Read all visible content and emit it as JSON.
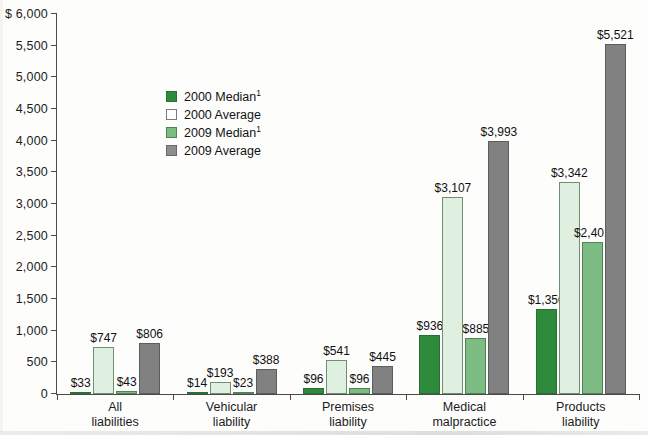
{
  "chart_data": {
    "type": "bar",
    "title": "",
    "xlabel": "",
    "ylabel": "",
    "y_axis_prefix": "$",
    "ylim": [
      0,
      6000
    ],
    "y_ticks": [
      0,
      500,
      1000,
      1500,
      2000,
      2500,
      3000,
      3500,
      4000,
      4500,
      5000,
      5500,
      6000
    ],
    "y_tick_labels": [
      "0",
      "500",
      "1,000",
      "1,500",
      "2,000",
      "2,500",
      "3,000",
      "3,500",
      "4,000",
      "4,500",
      "5,000",
      "5,500",
      "$ 6,000"
    ],
    "grid": false,
    "legend_position": "inside-upper-left",
    "categories": [
      "All liabilities",
      "Vehicular liability",
      "Premises liability",
      "Medical malpractice",
      "Products liability"
    ],
    "category_lines": [
      [
        "All",
        "liabilities"
      ],
      [
        "Vehicular",
        "liability"
      ],
      [
        "Premises",
        "liability"
      ],
      [
        "Medical",
        "malpractice"
      ],
      [
        "Products",
        "liability"
      ]
    ],
    "series": [
      {
        "name": "2000 Median",
        "footnote": "1",
        "color": "#2f8b3c",
        "values": [
          33,
          747,
          96,
          936,
          1350
        ],
        "labels": [
          "$33",
          "$747",
          "$96",
          "$936",
          "$1,350"
        ]
      },
      {
        "name": "2000 Average",
        "footnote": "",
        "color": "#dff0e0",
        "values": [
          747,
          193,
          541,
          3107,
          3342
        ],
        "labels": [
          "$747",
          "$193",
          "$541",
          "$3,107",
          "$3,342"
        ]
      },
      {
        "name": "2009 Median",
        "footnote": "1",
        "color": "#7dbc83",
        "values": [
          43,
          23,
          96,
          885,
          2401
        ],
        "labels": [
          "$43",
          "$23",
          "$96",
          "$885",
          "$2,401"
        ]
      },
      {
        "name": "2009 Average",
        "footnote": "",
        "color": "#818181",
        "values": [
          806,
          388,
          445,
          3993,
          5521
        ],
        "labels": [
          "$806",
          "$388",
          "$445",
          "$3,993",
          "$5,521"
        ]
      }
    ],
    "groups": [
      {
        "category": "All liabilities",
        "bars": [
          {
            "series": "2000 Median",
            "value": 33,
            "label": "$33"
          },
          {
            "series": "2000 Average",
            "value": 747,
            "label": "$747"
          },
          {
            "series": "2009 Median",
            "value": 43,
            "label": "$43"
          },
          {
            "series": "2009 Average",
            "value": 806,
            "label": "$806"
          }
        ]
      },
      {
        "category": "Vehicular liability",
        "bars": [
          {
            "series": "2000 Median",
            "value": 14,
            "label": "$14"
          },
          {
            "series": "2000 Average",
            "value": 193,
            "label": "$193"
          },
          {
            "series": "2009 Median",
            "value": 23,
            "label": "$23"
          },
          {
            "series": "2009 Average",
            "value": 388,
            "label": "$388"
          }
        ]
      },
      {
        "category": "Premises liability",
        "bars": [
          {
            "series": "2000 Median",
            "value": 96,
            "label": "$96"
          },
          {
            "series": "2000 Average",
            "value": 541,
            "label": "$541"
          },
          {
            "series": "2009 Median",
            "value": 96,
            "label": "$96"
          },
          {
            "series": "2009 Average",
            "value": 445,
            "label": "$445"
          }
        ]
      },
      {
        "category": "Medical malpractice",
        "bars": [
          {
            "series": "2000 Median",
            "value": 936,
            "label": "$936"
          },
          {
            "series": "2000 Average",
            "value": 3107,
            "label": "$3,107"
          },
          {
            "series": "2009 Median",
            "value": 885,
            "label": "$885"
          },
          {
            "series": "2009 Average",
            "value": 3993,
            "label": "$3,993"
          }
        ]
      },
      {
        "category": "Products liability",
        "bars": [
          {
            "series": "2000 Median",
            "value": 1350,
            "label": "$1,350"
          },
          {
            "series": "2000 Average",
            "value": 3342,
            "label": "$3,342"
          },
          {
            "series": "2009 Median",
            "value": 2401,
            "label": "$2,401"
          },
          {
            "series": "2009 Average",
            "value": 5521,
            "label": "$5,521"
          }
        ]
      }
    ]
  },
  "legend": {
    "items": [
      {
        "label": "2000 Median",
        "sup": "1",
        "key": "c2000med"
      },
      {
        "label": "2000 Average",
        "sup": "",
        "key": "c2000avg"
      },
      {
        "label": "2009 Median",
        "sup": "1",
        "key": "c2009med"
      },
      {
        "label": "2009 Average",
        "sup": "",
        "key": "c2009avg"
      }
    ]
  }
}
